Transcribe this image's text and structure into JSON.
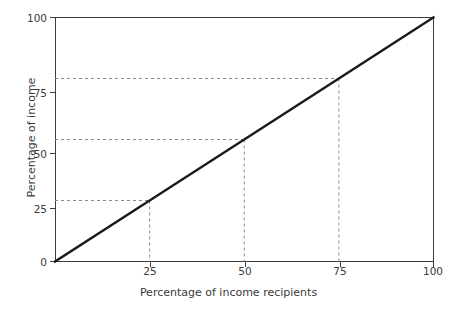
{
  "chart_data": {
    "type": "line",
    "title": "",
    "subtitle": "",
    "xlabel": "Percentage of income recipients",
    "ylabel": "Percentage of income",
    "xlim": [
      0,
      100
    ],
    "ylim": [
      0,
      100
    ],
    "xticks": [
      0,
      25,
      50,
      75,
      100
    ],
    "xtick_labels": [
      "",
      "25",
      "50",
      "75",
      "100"
    ],
    "yticks": [
      0,
      25,
      50,
      75,
      100
    ],
    "ytick_labels": [
      "0",
      "25",
      "50",
      "75",
      "100"
    ],
    "grid": false,
    "legend": "none",
    "series": [
      {
        "name": "Line of perfect equality",
        "color": "#1a1a1a",
        "x": [
          0,
          25,
          50,
          75,
          100
        ],
        "values": [
          0,
          25,
          50,
          75,
          100
        ]
      }
    ],
    "annotations": [
      {
        "label": "guide at 25",
        "x": 25,
        "y": 25,
        "style": "dashed"
      },
      {
        "label": "guide at 50",
        "x": 50,
        "y": 50,
        "style": "dashed"
      },
      {
        "label": "guide at 75",
        "x": 75,
        "y": 75,
        "style": "dashed"
      }
    ],
    "guide_color": "#8a8a8a",
    "axis_color": "#3c3c3c",
    "background": "#ffffff"
  }
}
